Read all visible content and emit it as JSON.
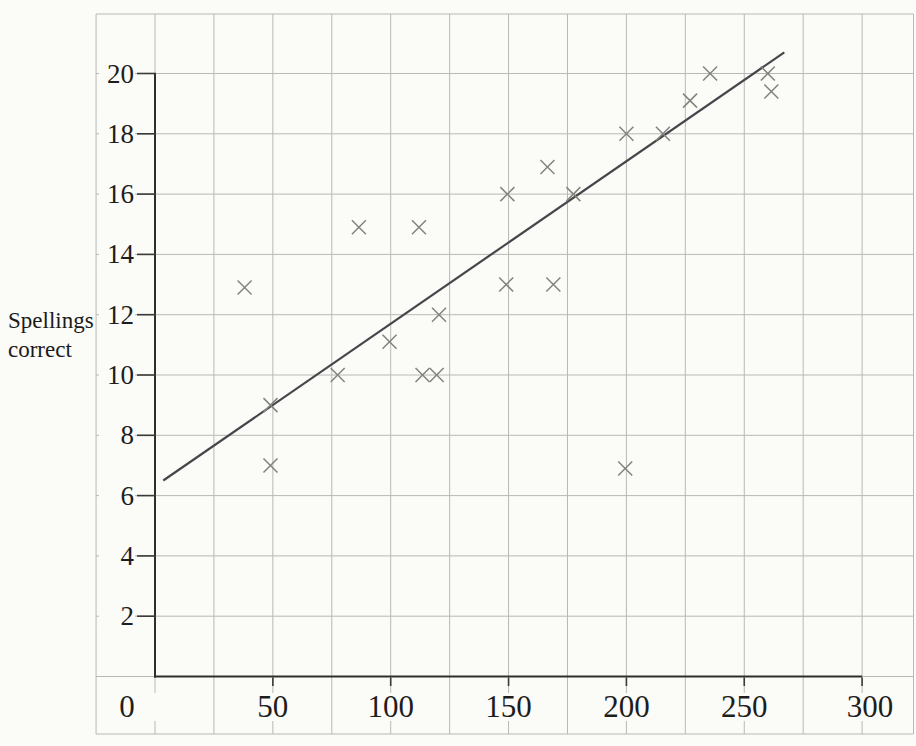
{
  "page": {
    "background": "#fbfbf8"
  },
  "chart_data": {
    "type": "scatter",
    "title": "",
    "xlabel": "",
    "ylabel": "Spellings correct",
    "ylabel_lines": [
      "Spellings",
      "correct"
    ],
    "x_tick_labels": [
      "0",
      "50",
      "100",
      "150",
      "200",
      "250",
      "300"
    ],
    "x_ticks": [
      0,
      50,
      100,
      150,
      200,
      250,
      300
    ],
    "y_tick_labels": [
      "20",
      "18",
      "16",
      "14",
      "12",
      "10",
      "8",
      "6",
      "4",
      "2"
    ],
    "y_ticks": [
      20,
      18,
      16,
      14,
      12,
      10,
      8,
      6,
      4,
      2
    ],
    "xlim": [
      -25,
      325
    ],
    "ylim": [
      -2,
      22
    ],
    "x_grid_step": 25,
    "y_grid_step": 2,
    "grid": true,
    "legend": "none",
    "marker": "x",
    "points": [
      [
        38,
        12.9
      ],
      [
        49,
        9
      ],
      [
        49,
        7
      ],
      [
        77.5,
        10
      ],
      [
        86.5,
        14.9
      ],
      [
        99.5,
        11.1
      ],
      [
        112,
        14.9
      ],
      [
        113.5,
        10
      ],
      [
        119.5,
        10
      ],
      [
        120.5,
        12
      ],
      [
        149.5,
        16
      ],
      [
        149,
        13
      ],
      [
        166.5,
        16.9
      ],
      [
        169,
        13
      ],
      [
        177.5,
        16
      ],
      [
        200,
        18
      ],
      [
        199.5,
        6.9
      ],
      [
        215.5,
        18
      ],
      [
        227,
        19.1
      ],
      [
        235.5,
        20
      ],
      [
        260,
        20
      ],
      [
        261.5,
        19.4
      ]
    ],
    "best_fit_line": {
      "x1": 3.5,
      "y1": 6.5,
      "x2": 267,
      "y2": 20.7
    },
    "colors": {
      "grid": "#b8b9b4",
      "axis": "#2e2e2c",
      "best_fit": "#45464a",
      "marker": "#82837d",
      "tick": "#3a3a38",
      "text": "#1d1d1c"
    }
  }
}
